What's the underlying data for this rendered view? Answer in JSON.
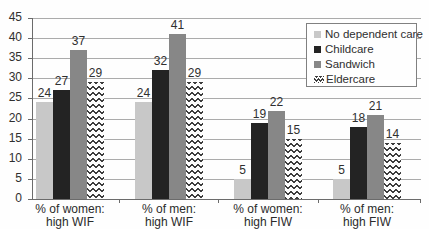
{
  "colors": {
    "background": "#fefefe",
    "axis": "#6b6b6b",
    "gridline": "#ababab",
    "text": "#2f2f2f",
    "legend_border": "#808080"
  },
  "chart_data": {
    "type": "bar",
    "title": "",
    "xlabel": "",
    "ylabel": "",
    "ylim": [
      0,
      45
    ],
    "ytick_step": 5,
    "yticks": [
      0,
      5,
      10,
      15,
      20,
      25,
      30,
      35,
      40,
      45
    ],
    "grid": true,
    "data_labels": true,
    "legend_position": "top-right",
    "categories": [
      "% of women: high WIF",
      "% of men: high WIF",
      "% of women: high FIW",
      "% of men: high FIW"
    ],
    "category_lines": [
      [
        "% of women:",
        "high WIF"
      ],
      [
        "% of men:",
        "high WIF"
      ],
      [
        "% of women:",
        "high FIW"
      ],
      [
        "% of men:",
        "high FIW"
      ]
    ],
    "series": [
      {
        "name": "No dependent care",
        "color": "#c8c8c8",
        "fill": "solid",
        "values": [
          24,
          24,
          5,
          5
        ]
      },
      {
        "name": "Childcare",
        "color": "#232323",
        "fill": "solid",
        "values": [
          27,
          32,
          19,
          18
        ]
      },
      {
        "name": "Sandwich",
        "color": "#878787",
        "fill": "solid",
        "values": [
          37,
          41,
          22,
          21
        ]
      },
      {
        "name": "Eldercare",
        "color": "#3d3d3d",
        "fill": "zigzag",
        "values": [
          29,
          29,
          15,
          14
        ]
      }
    ]
  }
}
